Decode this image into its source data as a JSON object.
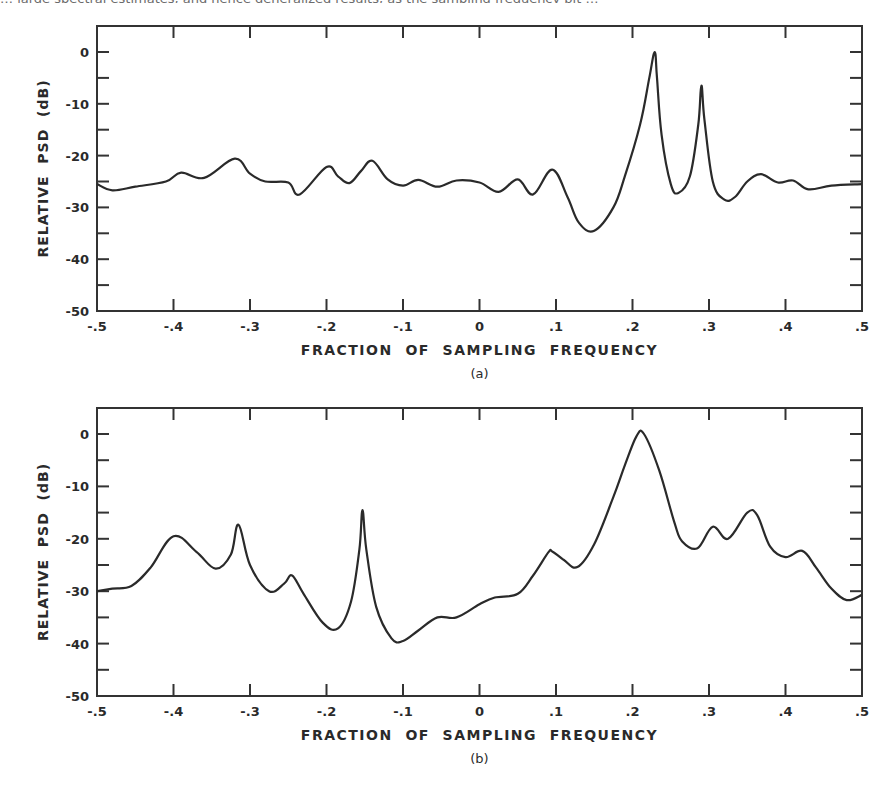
{
  "chart_data": [
    {
      "type": "line",
      "panel_label": "(a)",
      "title": "",
      "xlabel": "FRACTION OF SAMPLING FREQUENCY",
      "ylabel": "RELATIVE PSD (dB)",
      "xlim": [
        -0.5,
        0.5
      ],
      "ylim": [
        -50,
        5
      ],
      "xticks": [
        -0.5,
        -0.4,
        -0.3,
        -0.2,
        -0.1,
        0,
        0.1,
        0.2,
        0.3,
        0.4,
        0.5
      ],
      "xtick_labels": [
        "-.5",
        "-.4",
        "-.3",
        "-.2",
        "-.1",
        "0",
        ".1",
        ".2",
        ".3",
        ".4",
        ".5"
      ],
      "yticks": [
        0,
        -10,
        -20,
        -30,
        -40,
        -50
      ],
      "ytick_labels": [
        "0",
        "-10",
        "-20",
        "-30",
        "-40",
        "-50"
      ],
      "grid": false,
      "legend": null,
      "x": [
        -0.5,
        -0.48,
        -0.45,
        -0.41,
        -0.39,
        -0.36,
        -0.32,
        -0.3,
        -0.28,
        -0.25,
        -0.235,
        -0.2,
        -0.185,
        -0.17,
        -0.155,
        -0.14,
        -0.12,
        -0.1,
        -0.08,
        -0.055,
        -0.03,
        0.0,
        0.025,
        0.05,
        0.07,
        0.095,
        0.115,
        0.13,
        0.15,
        0.175,
        0.19,
        0.21,
        0.222,
        0.229,
        0.232,
        0.238,
        0.25,
        0.26,
        0.275,
        0.286,
        0.29,
        0.294,
        0.305,
        0.32,
        0.334,
        0.35,
        0.368,
        0.39,
        0.41,
        0.43,
        0.46,
        0.5
      ],
      "y": [
        -25.5,
        -26.7,
        -26.0,
        -25.0,
        -23.3,
        -24.3,
        -20.6,
        -23.5,
        -25.0,
        -25.2,
        -27.5,
        -22.2,
        -24.0,
        -25.3,
        -23.0,
        -21.0,
        -24.6,
        -25.8,
        -24.7,
        -26.0,
        -24.8,
        -25.2,
        -27.0,
        -24.6,
        -27.5,
        -22.7,
        -28.0,
        -33.0,
        -34.5,
        -30.0,
        -24.0,
        -14.0,
        -5.0,
        0.0,
        -5.0,
        -16.0,
        -25.5,
        -27.2,
        -24.0,
        -14.0,
        -6.5,
        -13.0,
        -25.0,
        -28.5,
        -28.0,
        -25.0,
        -23.6,
        -25.2,
        -24.8,
        -26.5,
        -25.8,
        -25.5
      ]
    },
    {
      "type": "line",
      "panel_label": "(b)",
      "title": "",
      "xlabel": "FRACTION OF SAMPLING FREQUENCY",
      "ylabel": "RELATIVE PSD (dB)",
      "xlim": [
        -0.5,
        0.5
      ],
      "ylim": [
        -50,
        5
      ],
      "xticks": [
        -0.5,
        -0.4,
        -0.3,
        -0.2,
        -0.1,
        0,
        0.1,
        0.2,
        0.3,
        0.4,
        0.5
      ],
      "xtick_labels": [
        "-.5",
        "-.4",
        "-.3",
        "-.2",
        "-.1",
        "0",
        ".1",
        ".2",
        ".3",
        ".4",
        ".5"
      ],
      "yticks": [
        0,
        -10,
        -20,
        -30,
        -40,
        -50
      ],
      "ytick_labels": [
        "0",
        "-10",
        "-20",
        "-30",
        "-40",
        "-50"
      ],
      "grid": false,
      "legend": null,
      "x": [
        -0.5,
        -0.48,
        -0.455,
        -0.43,
        -0.4,
        -0.37,
        -0.345,
        -0.325,
        -0.315,
        -0.3,
        -0.275,
        -0.255,
        -0.245,
        -0.23,
        -0.205,
        -0.185,
        -0.168,
        -0.157,
        -0.153,
        -0.148,
        -0.135,
        -0.115,
        -0.1,
        -0.08,
        -0.055,
        -0.03,
        0.0,
        0.02,
        0.05,
        0.07,
        0.09,
        0.095,
        0.11,
        0.128,
        0.15,
        0.175,
        0.19,
        0.205,
        0.215,
        0.235,
        0.255,
        0.265,
        0.285,
        0.305,
        0.325,
        0.35,
        0.363,
        0.38,
        0.4,
        0.422,
        0.44,
        0.46,
        0.48,
        0.5
      ],
      "y": [
        -30.0,
        -29.5,
        -29.0,
        -25.5,
        -19.5,
        -22.5,
        -25.7,
        -23.0,
        -17.3,
        -25.0,
        -30.0,
        -28.5,
        -27.0,
        -30.5,
        -36.0,
        -37.1,
        -32.0,
        -22.0,
        -14.5,
        -22.0,
        -33.0,
        -39.0,
        -39.5,
        -37.5,
        -35.0,
        -35.0,
        -32.5,
        -31.2,
        -30.5,
        -27.0,
        -22.6,
        -22.4,
        -24.0,
        -25.4,
        -21.0,
        -12.0,
        -6.0,
        -0.5,
        0.0,
        -7.0,
        -17.0,
        -20.5,
        -21.8,
        -17.7,
        -20.0,
        -15.0,
        -15.5,
        -21.5,
        -23.5,
        -22.3,
        -25.5,
        -29.5,
        -31.7,
        -30.7
      ]
    }
  ],
  "figure": {
    "clipped_text_top": "… large spectral estimates, and hence generalized results, as the sampling frequency bit …",
    "panels": [
      {
        "id": "a",
        "caption": "(a)",
        "xlabel": "FRACTION OF SAMPLING FREQUENCY",
        "ylabel_parts": [
          "RELATIVE",
          "PSD",
          "(dB)"
        ]
      },
      {
        "id": "b",
        "caption": "(b)",
        "xlabel": "FRACTION OF SAMPLING FREQUENCY",
        "ylabel_parts": [
          "RELATIVE",
          "PSD",
          "(dB)"
        ]
      }
    ]
  },
  "colors": {
    "line": "#2a2a2a",
    "axis": "#333333",
    "background": "#ffffff"
  }
}
